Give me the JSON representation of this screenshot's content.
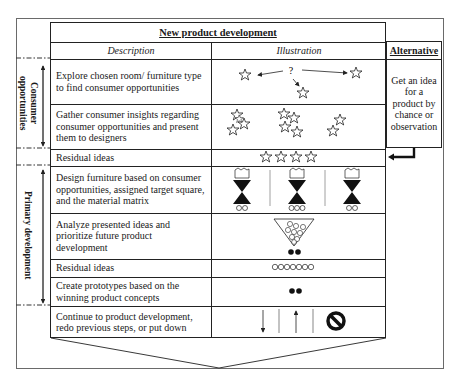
{
  "diagram": {
    "title": "New product development",
    "columns": {
      "description": "Description",
      "illustration": "Illustration",
      "alternative": "Alternative"
    },
    "alternative_text": "Get an idea for a product by chance or observation",
    "phases": [
      {
        "label": "Consumer opportunities",
        "rows": [
          0,
          1
        ]
      },
      {
        "label": "Primary development",
        "rows": [
          3,
          4,
          5,
          6
        ]
      }
    ],
    "rows": [
      {
        "description": "Explore chosen room/ furniture type to find consumer opportunities",
        "illustration": "stars-with-question-mark-arrows"
      },
      {
        "description": "Gather consumer insights regarding consumer opportunities and present them to designers",
        "illustration": "three-star-clusters"
      },
      {
        "description": "Residual ideas",
        "illustration": "four-stars"
      },
      {
        "description": "Design furniture based on consumer opportunities, assigned target square, and the material matrix",
        "illustration": "three-hourglass-filters"
      },
      {
        "description": "Analyze presented ideas and prioritize future product development",
        "illustration": "triangle-funnel-two-dots"
      },
      {
        "description": "Residual ideas",
        "illustration": "seven-circles"
      },
      {
        "description": "Create prototypes based on the winning product concepts",
        "illustration": "two-dots"
      },
      {
        "description": "Continue to product development, redo previous steps, or put down",
        "illustration": "down-arrow-up-arrow-prohibited"
      }
    ],
    "illustration_symbols": {
      "question_mark": "?",
      "hourglass_outputs": [
        2,
        3,
        2
      ],
      "funnel_circles": 9,
      "funnel_outputs": 2,
      "residual_circles": 7,
      "prototype_dots": 2
    }
  }
}
